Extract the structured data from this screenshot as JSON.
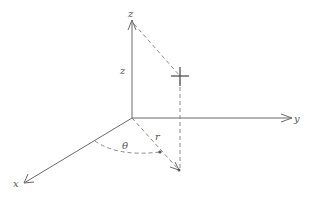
{
  "diagram": {
    "type": "3d-coordinate-system",
    "axes": {
      "x": {
        "label": "x"
      },
      "y": {
        "label": "y"
      },
      "z": {
        "label": "z"
      }
    },
    "annotations": {
      "height_label": "z",
      "radius_label": "r",
      "angle_label": "θ"
    },
    "colors": {
      "line": "#6b6b6b",
      "text": "#555555",
      "background": "#ffffff"
    }
  }
}
